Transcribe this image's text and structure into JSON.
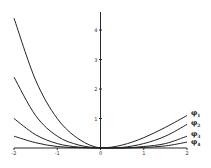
{
  "chart_data": {
    "type": "line",
    "title": "",
    "xlabel": "",
    "ylabel": "",
    "xlim": [
      -2,
      2
    ],
    "ylim": [
      0,
      4.5
    ],
    "x_ticks": [
      -2,
      -1,
      0,
      1,
      2
    ],
    "y_ticks": [
      0,
      1,
      2,
      3,
      4
    ],
    "grid": false,
    "legend_position": "right-inline",
    "x": [
      -2,
      -1.5,
      -1,
      -0.5,
      0,
      0.5,
      1,
      1.5,
      2
    ],
    "series": [
      {
        "name": "φ1",
        "values": [
          4.4,
          2.3,
          1.0,
          0.3,
          0.0,
          0.1,
          0.35,
          0.7,
          1.1
        ]
      },
      {
        "name": "φ2",
        "values": [
          2.4,
          1.1,
          0.4,
          0.1,
          0.0,
          0.02,
          0.15,
          0.4,
          0.8
        ]
      },
      {
        "name": "φ3",
        "values": [
          1.0,
          0.45,
          0.15,
          0.03,
          0.0,
          0.0,
          0.05,
          0.15,
          0.4
        ]
      },
      {
        "name": "φ4",
        "values": [
          0.4,
          0.18,
          0.05,
          0.01,
          0.0,
          0.0,
          0.02,
          0.07,
          0.2
        ]
      }
    ]
  },
  "legend": {
    "labels": [
      "φ1",
      "φ2",
      "φ3",
      "φ4"
    ]
  },
  "axes": {
    "x_tick_labels": [
      "-2",
      "-1",
      "0",
      "1",
      "2"
    ],
    "y_tick_labels": [
      "0",
      "1",
      "2",
      "3",
      "4"
    ]
  }
}
